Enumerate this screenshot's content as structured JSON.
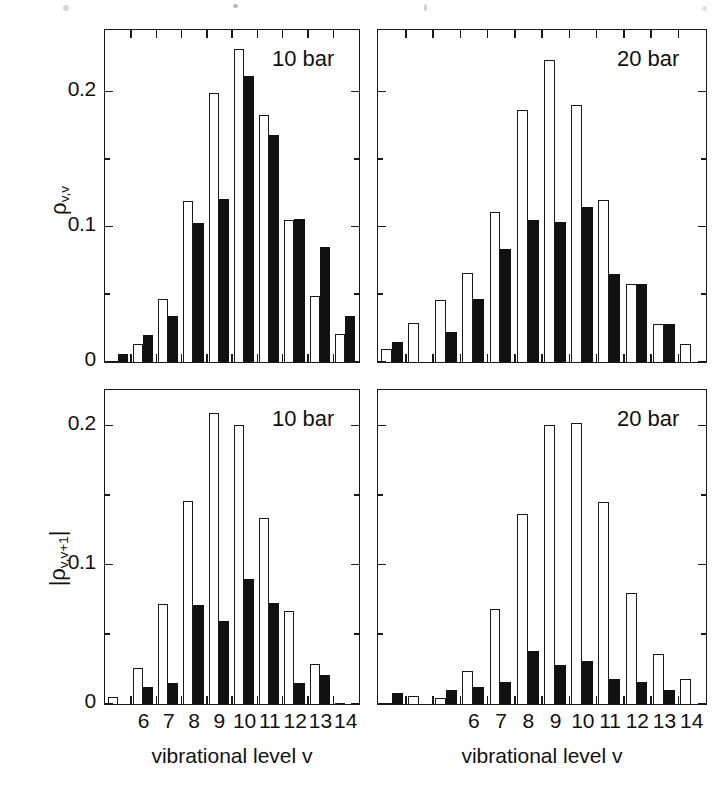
{
  "figure": {
    "axis_title_x": "vibrational level v",
    "background": "#ffffff",
    "ink": "#111111"
  },
  "panels": [
    {
      "id": "panel-tl",
      "note": "10 bar",
      "ylabel": "ρ",
      "ylabel_sub": "v,v",
      "ylabel_full": "ρv,v",
      "ytick_labels": [
        "0",
        "0.1",
        "0.2"
      ],
      "xtick_labels": [
        "6",
        "7",
        "8",
        "9",
        "10",
        "11",
        "12",
        "13",
        "14"
      ]
    },
    {
      "id": "panel-tr",
      "note": "20 bar",
      "ylabel": "",
      "ylabel_sub": "",
      "ylabel_full": "",
      "ytick_labels": [],
      "xtick_labels": [
        "6",
        "7",
        "8",
        "9",
        "10",
        "11",
        "12",
        "13",
        "14"
      ]
    },
    {
      "id": "panel-bl",
      "note": "10 bar",
      "ylabel": "|ρ",
      "ylabel_sub": "v,v+1",
      "ylabel_full": "|ρv,v+1|",
      "ytick_labels": [
        "0",
        "0.1",
        "0.2"
      ],
      "xtick_labels": [
        "6",
        "7",
        "8",
        "9",
        "10",
        "11",
        "12",
        "13",
        "14"
      ]
    },
    {
      "id": "panel-br",
      "note": "20 bar",
      "ylabel": "",
      "ylabel_sub": "",
      "ylabel_full": "",
      "ytick_labels": [],
      "xtick_labels": [
        "6",
        "7",
        "8",
        "9",
        "10",
        "11",
        "12",
        "13",
        "14"
      ]
    }
  ],
  "chart_data": [
    {
      "panel": "top-left",
      "type": "bar",
      "title": "10 bar",
      "xlabel": "vibrational level v",
      "ylabel": "ρv,v",
      "ylim": [
        0,
        0.245
      ],
      "yticks_major": [
        0,
        0.1,
        0.2
      ],
      "yticks_minor": [
        0.05,
        0.15
      ],
      "xlim": [
        5.4,
        14.6
      ],
      "categories": [
        6,
        7,
        8,
        9,
        10,
        11,
        12,
        13,
        14
      ],
      "grid": false,
      "legend": "none",
      "series": [
        {
          "name": "open",
          "color": "#ffffff",
          "edge": "#111111",
          "values": [
            0.0,
            0.013,
            0.047,
            0.119,
            0.199,
            0.232,
            0.183,
            0.105,
            0.049,
            0.021
          ]
        },
        {
          "name": "filled",
          "color": "#111111",
          "edge": "#111111",
          "values": [
            0.006,
            0.02,
            0.034,
            0.103,
            0.121,
            0.212,
            0.168,
            0.106,
            0.085,
            0.034
          ]
        }
      ],
      "note": "bar pairs: open bar left, filled bar right; leading pair at v=5.5 partial"
    },
    {
      "panel": "top-right",
      "type": "bar",
      "title": "20 bar",
      "xlabel": "vibrational level v",
      "ylabel": "ρv,v",
      "ylim": [
        0,
        0.245
      ],
      "yticks_major": [
        0,
        0.1,
        0.2
      ],
      "yticks_minor": [
        0.05,
        0.15
      ],
      "xlim": [
        5.4,
        14.6
      ],
      "categories": [
        6,
        7,
        8,
        9,
        10,
        11,
        12,
        13,
        14
      ],
      "grid": false,
      "legend": "none",
      "series": [
        {
          "name": "open",
          "color": "#ffffff",
          "edge": "#111111",
          "values": [
            0.01,
            0.029,
            0.046,
            0.066,
            0.111,
            0.187,
            0.224,
            0.19,
            0.12,
            0.058,
            0.028,
            0.013
          ]
        },
        {
          "name": "filled",
          "color": "#111111",
          "edge": "#111111",
          "values": [
            0.015,
            0.0,
            0.022,
            0.047,
            0.084,
            0.105,
            0.104,
            0.115,
            0.065,
            0.058,
            0.028,
            0.0
          ]
        }
      ]
    },
    {
      "panel": "bottom-left",
      "type": "bar",
      "title": "10 bar",
      "xlabel": "vibrational level v",
      "ylabel": "|ρv,v+1|",
      "ylim": [
        0,
        0.225
      ],
      "yticks_major": [
        0,
        0.1,
        0.2
      ],
      "yticks_minor": [
        0.05,
        0.15
      ],
      "xlim": [
        5.4,
        14.6
      ],
      "categories": [
        6,
        7,
        8,
        9,
        10,
        11,
        12,
        13,
        14
      ],
      "grid": false,
      "legend": "none",
      "series": [
        {
          "name": "open",
          "color": "#ffffff",
          "edge": "#111111",
          "values": [
            0.005,
            0.026,
            0.072,
            0.146,
            0.209,
            0.201,
            0.134,
            0.067,
            0.029,
            0.0
          ]
        },
        {
          "name": "filled",
          "color": "#111111",
          "edge": "#111111",
          "values": [
            0.0,
            0.012,
            0.015,
            0.071,
            0.06,
            0.09,
            0.073,
            0.015,
            0.021,
            0.0
          ]
        }
      ]
    },
    {
      "panel": "bottom-right",
      "type": "bar",
      "title": "20 bar",
      "xlabel": "vibrational level v",
      "ylabel": "|ρv,v+1|",
      "ylim": [
        0,
        0.225
      ],
      "yticks_major": [
        0,
        0.1,
        0.2
      ],
      "yticks_minor": [
        0.05,
        0.15
      ],
      "xlim": [
        5.4,
        14.6
      ],
      "categories": [
        6,
        7,
        8,
        9,
        10,
        11,
        12,
        13,
        14
      ],
      "grid": false,
      "legend": "none",
      "series": [
        {
          "name": "open",
          "color": "#ffffff",
          "edge": "#111111",
          "values": [
            0.0,
            0.006,
            0.004,
            0.024,
            0.068,
            0.137,
            0.201,
            0.202,
            0.145,
            0.08,
            0.036,
            0.018
          ]
        },
        {
          "name": "filled",
          "color": "#111111",
          "edge": "#111111",
          "values": [
            0.008,
            0.0,
            0.01,
            0.012,
            0.016,
            0.038,
            0.028,
            0.031,
            0.018,
            0.016,
            0.01,
            0.0
          ]
        }
      ]
    }
  ]
}
